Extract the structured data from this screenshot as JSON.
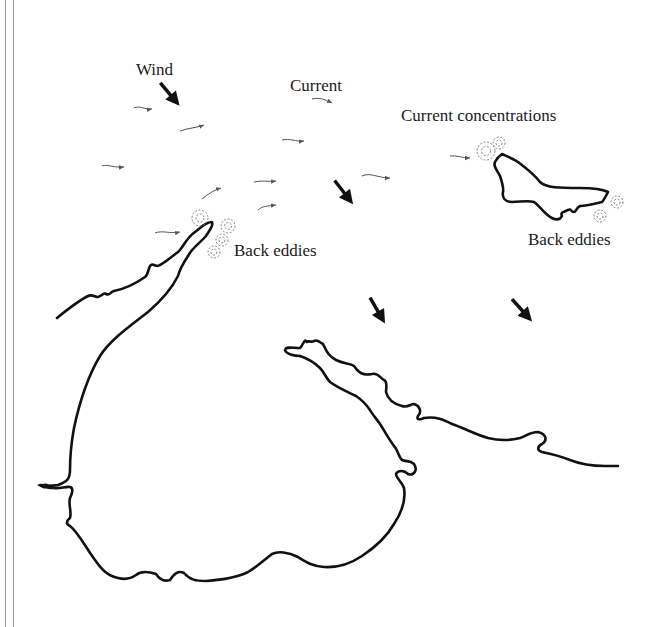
{
  "diagram": {
    "type": "coastal current and wind map",
    "labels": {
      "wind": "Wind",
      "current": "Current",
      "current_concentrations": "Current concentrations",
      "back_eddies_peninsula": "Back eddies",
      "back_eddies_island": "Back eddies"
    },
    "legend_symbols": {
      "wind_arrow": "thick black arrow pointing south-east",
      "current_arrow": "thin wavy arrow pointing east",
      "eddy": "dashed concentric circle"
    },
    "wind_arrow_count": 5,
    "current_arrow_count": 11,
    "colors": {
      "ink": "#111111",
      "current_ink": "#555555",
      "eddy_ink": "#777777",
      "frame": "#9a9a9a",
      "background": "#ffffff"
    }
  }
}
